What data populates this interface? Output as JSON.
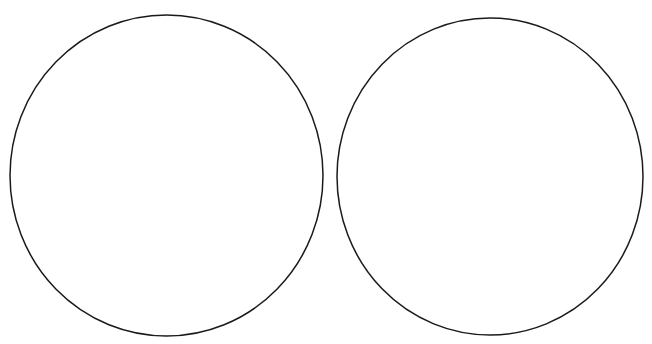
{
  "diagram": {
    "background": "#ffffff",
    "stroke_color": "#1a1a1a",
    "stroke_width": 1.5,
    "shapes": [
      {
        "type": "ellipse",
        "id": "left-circle",
        "cx": 166.5,
        "cy": 175.5,
        "rx": 156.5,
        "ry": 160.5,
        "fill": "none"
      },
      {
        "type": "ellipse",
        "id": "right-circle",
        "cx": 490,
        "cy": 176.5,
        "rx": 153,
        "ry": 158.5,
        "fill": "none"
      }
    ]
  }
}
